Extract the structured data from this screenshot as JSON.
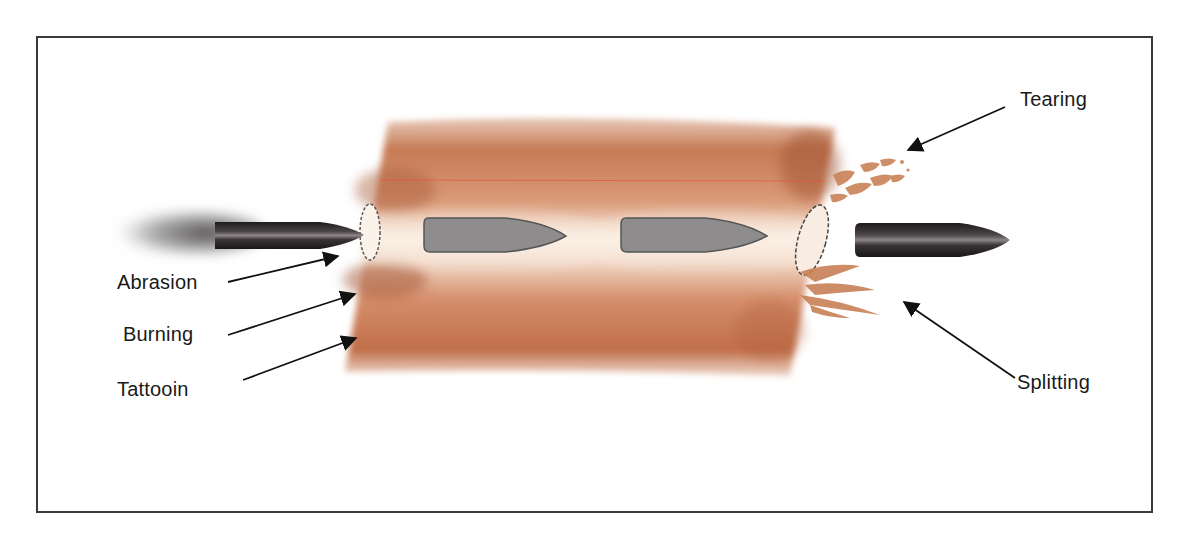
{
  "diagram": {
    "labels": {
      "abrasion": "Abrasion",
      "burning": "Burning",
      "tattooin": "Tattooin",
      "tearing": "Tearing",
      "splitting": "Splitting"
    },
    "colors": {
      "frame": "#3a3a3a",
      "tissue_dark": "#b0603a",
      "tissue_mid": "#d49070",
      "tissue_light": "#f3ddcc",
      "bullet_dark": "#2a2628",
      "bullet_inner": "#8e8c8d",
      "arrow": "#111111",
      "scar_line": "#e8553a"
    }
  }
}
